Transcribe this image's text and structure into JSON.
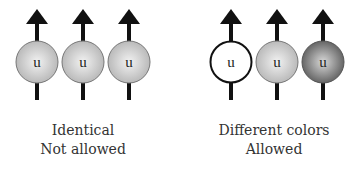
{
  "groups": [
    {
      "caption_line1": "Identical",
      "caption_line2": "Not allowed",
      "particles": [
        {
          "letter": "u",
          "color": "light-gray",
          "fill": "#c8c8c8"
        },
        {
          "letter": "u",
          "color": "light-gray",
          "fill": "#c8c8c8"
        },
        {
          "letter": "u",
          "color": "light-gray",
          "fill": "#c8c8c8"
        }
      ]
    },
    {
      "caption_line1": "Different colors",
      "caption_line2": "Allowed",
      "particles": [
        {
          "letter": "u",
          "color": "white",
          "fill": "#ffffff"
        },
        {
          "letter": "u",
          "color": "light-gray",
          "fill": "#c8c8c8"
        },
        {
          "letter": "u",
          "color": "dark-gray",
          "fill": "#7a7a7a"
        }
      ]
    }
  ]
}
